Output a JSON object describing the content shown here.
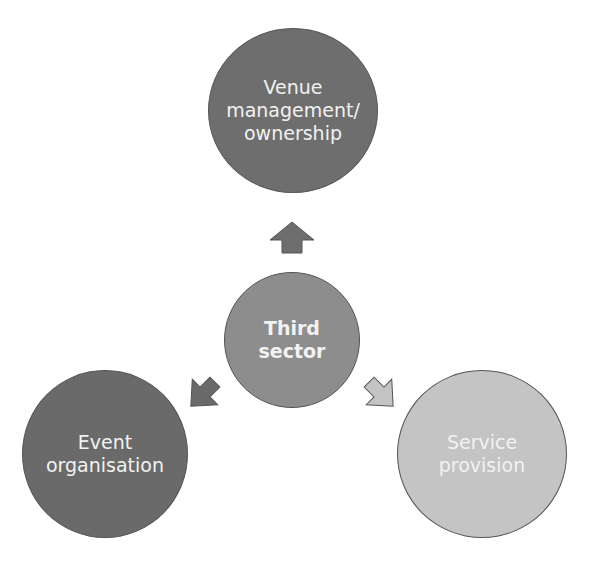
{
  "diagram": {
    "type": "radial",
    "center": {
      "label": "Third\nsector",
      "lines": [
        "Third",
        "sector"
      ],
      "color": "#8d8d8d"
    },
    "nodes": [
      {
        "id": "top",
        "lines": [
          "Venue",
          "management/",
          "ownership"
        ],
        "color": "#6e6e6e"
      },
      {
        "id": "left",
        "lines": [
          "Event",
          "organisation"
        ],
        "color": "#6a6a6a"
      },
      {
        "id": "right",
        "lines": [
          "Service",
          "provision"
        ],
        "color": "#c4c4c4"
      }
    ],
    "arrows": [
      {
        "from": "center",
        "to": "top",
        "color": "#6e6e6e"
      },
      {
        "from": "center",
        "to": "left",
        "color": "#6a6a6a"
      },
      {
        "from": "center",
        "to": "right",
        "color": "#c4c4c4"
      }
    ]
  }
}
